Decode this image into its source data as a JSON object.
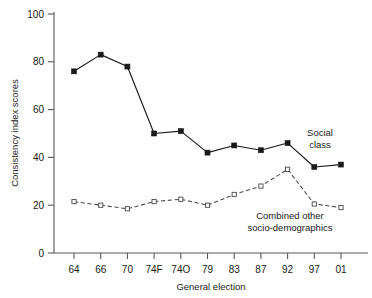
{
  "chart_data": {
    "type": "line",
    "title": "",
    "xlabel": "General election",
    "ylabel": "Consistency index scores",
    "categories": [
      "64",
      "66",
      "70",
      "74F",
      "74O",
      "79",
      "83",
      "87",
      "92",
      "97",
      "01"
    ],
    "ylim": [
      0,
      100
    ],
    "yticks": [
      0,
      20,
      40,
      60,
      80,
      100
    ],
    "ytick_labels": [
      "0",
      "20",
      "40",
      "60",
      "80",
      "100"
    ],
    "grid": false,
    "legend_position": "inline-annotations",
    "series": [
      {
        "name": "Social class",
        "marker": "filled-square",
        "line_style": "solid",
        "color": "#1a1a1a",
        "values": [
          76,
          83,
          78,
          50,
          51,
          42,
          45,
          43,
          46,
          36,
          37
        ]
      },
      {
        "name": "Combined other socio-demographics",
        "marker": "open-square",
        "line_style": "dashed",
        "color": "#4a4a4a",
        "values": [
          21.5,
          20,
          18.5,
          21.5,
          22.5,
          20,
          24.5,
          28,
          35,
          20.5,
          19
        ]
      }
    ],
    "annotations": [
      {
        "id": "social-class",
        "lines": [
          "Social",
          "class"
        ]
      },
      {
        "id": "combined-other",
        "lines": [
          "Combined other",
          "socio-demographics"
        ]
      }
    ]
  },
  "annotations": {
    "social_class_line1": "Social",
    "social_class_line2": "class",
    "combined_line1": "Combined other",
    "combined_line2": "socio-demographics"
  }
}
